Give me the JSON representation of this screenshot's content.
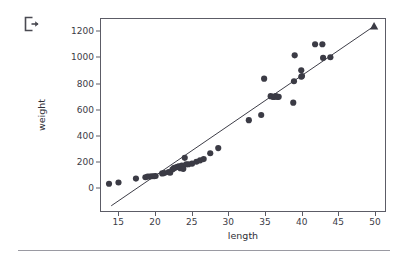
{
  "toolbar": {
    "export_icon_name": "export-icon"
  },
  "chart_data": {
    "type": "scatter",
    "title": "",
    "xlabel": "length",
    "ylabel": "weight",
    "xlim": [
      12.5,
      51.5
    ],
    "ylim": [
      -180,
      1300
    ],
    "xticks": [
      15,
      20,
      25,
      30,
      35,
      40,
      45,
      50
    ],
    "yticks": [
      0,
      200,
      400,
      600,
      800,
      1000,
      1200
    ],
    "grid": false,
    "legend": null,
    "marker_color": "#3b3b45",
    "line_color": "#3b3b45",
    "series": [
      {
        "name": "observations",
        "marker": "circle",
        "points": [
          [
            13.6,
            30
          ],
          [
            14.9,
            40
          ],
          [
            17.3,
            70
          ],
          [
            18.6,
            80
          ],
          [
            18.9,
            85
          ],
          [
            19.2,
            85
          ],
          [
            19.5,
            88
          ],
          [
            19.8,
            88
          ],
          [
            20.0,
            90
          ],
          [
            20.9,
            110
          ],
          [
            21.2,
            112
          ],
          [
            21.8,
            120
          ],
          [
            22.0,
            115
          ],
          [
            22.3,
            140
          ],
          [
            22.5,
            150
          ],
          [
            22.7,
            155
          ],
          [
            23.0,
            160
          ],
          [
            23.2,
            165
          ],
          [
            23.4,
            150
          ],
          [
            23.6,
            170
          ],
          [
            23.8,
            145
          ],
          [
            24.0,
            230
          ],
          [
            24.2,
            180
          ],
          [
            24.5,
            180
          ],
          [
            25.0,
            185
          ],
          [
            25.6,
            200
          ],
          [
            26.1,
            210
          ],
          [
            26.6,
            220
          ],
          [
            27.5,
            265
          ],
          [
            28.6,
            305
          ],
          [
            32.8,
            520
          ],
          [
            34.5,
            560
          ],
          [
            34.9,
            840
          ],
          [
            35.8,
            705
          ],
          [
            36.1,
            700
          ],
          [
            36.3,
            700
          ],
          [
            36.5,
            705
          ],
          [
            36.7,
            700
          ],
          [
            36.9,
            700
          ],
          [
            38.9,
            655
          ],
          [
            39.0,
            820
          ],
          [
            39.1,
            1020
          ],
          [
            40.0,
            905
          ],
          [
            40.0,
            855
          ],
          [
            40.1,
            860
          ],
          [
            41.9,
            1105
          ],
          [
            42.9,
            1105
          ],
          [
            43.0,
            1000
          ],
          [
            44.0,
            1005
          ]
        ]
      }
    ],
    "fit_line": {
      "name": "regression-line",
      "x_start": 13.9,
      "y_start": -140,
      "x_end": 50.0,
      "y_end": 1245,
      "end_marker": "triangle"
    }
  }
}
